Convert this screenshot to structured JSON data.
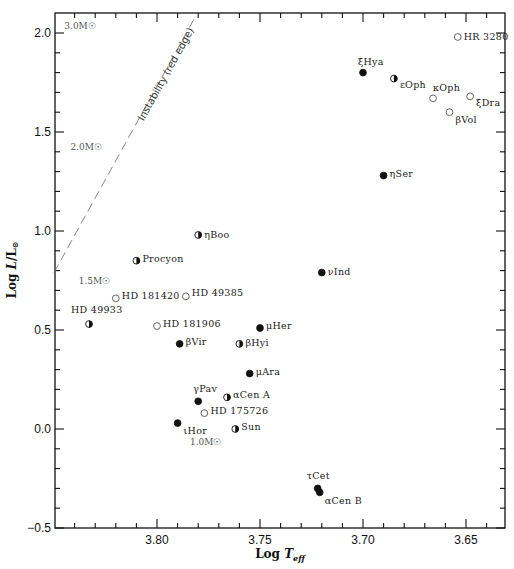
{
  "chart_data": {
    "type": "scatter",
    "title": "",
    "xlabel": "Log T_eff",
    "ylabel": "Log L/L_sun",
    "xlim": [
      3.85,
      3.631
    ],
    "ylim": [
      -0.5,
      2.1
    ],
    "x_inverted": true,
    "grid": false,
    "x_ticks": [
      3.8,
      3.75,
      3.7,
      3.65
    ],
    "x_tick_labels": [
      "3.80",
      "3.75",
      "3.70",
      "3.65"
    ],
    "y_ticks": [
      -0.5,
      0.0,
      0.5,
      1.0,
      1.5,
      2.0
    ],
    "y_tick_labels": [
      "-0.5",
      "0.0",
      "0.5",
      "1.0",
      "1.5",
      "2.0"
    ],
    "marker_legend": {
      "filled": "filled circle",
      "half": "half-filled circle",
      "open": "open circle"
    },
    "points": [
      {
        "name": "HR 3280",
        "logT": 3.654,
        "logL": 1.98,
        "marker": "open",
        "label_dx": 6,
        "label_dy": 0
      },
      {
        "name": "ξHya",
        "logT": 3.7,
        "logL": 1.8,
        "marker": "filled",
        "label_dx": -5,
        "label_dy": -11
      },
      {
        "name": "εOph",
        "logT": 3.685,
        "logL": 1.77,
        "marker": "half",
        "label_dx": 6,
        "label_dy": 6
      },
      {
        "name": "κOph",
        "logT": 3.666,
        "logL": 1.67,
        "marker": "open",
        "label_dx": 0,
        "label_dy": -10
      },
      {
        "name": "ξDra",
        "logT": 3.648,
        "logL": 1.68,
        "marker": "open",
        "label_dx": 6,
        "label_dy": 7
      },
      {
        "name": "βVol",
        "logT": 3.658,
        "logL": 1.6,
        "marker": "open",
        "label_dx": 6,
        "label_dy": 8
      },
      {
        "name": "ηSer",
        "logT": 3.69,
        "logL": 1.28,
        "marker": "filled",
        "label_dx": 6,
        "label_dy": -2
      },
      {
        "name": "ηBoo",
        "logT": 3.78,
        "logL": 0.98,
        "marker": "half",
        "label_dx": 6,
        "label_dy": 0
      },
      {
        "name": "Procyon",
        "logT": 3.81,
        "logL": 0.85,
        "marker": "half",
        "label_dx": 6,
        "label_dy": -2
      },
      {
        "name": "νInd",
        "logT": 3.72,
        "logL": 0.79,
        "marker": "filled",
        "label_dx": 6,
        "label_dy": -1
      },
      {
        "name": "HD 181420",
        "logT": 3.82,
        "logL": 0.66,
        "marker": "open",
        "label_dx": 6,
        "label_dy": -2
      },
      {
        "name": "HD 49385",
        "logT": 3.786,
        "logL": 0.67,
        "marker": "open",
        "label_dx": 6,
        "label_dy": -3
      },
      {
        "name": "HD 49933",
        "logT": 3.833,
        "logL": 0.53,
        "marker": "half",
        "label_dx": -18,
        "label_dy": -14
      },
      {
        "name": "HD 181906",
        "logT": 3.8,
        "logL": 0.52,
        "marker": "open",
        "label_dx": 6,
        "label_dy": -2
      },
      {
        "name": "μHer",
        "logT": 3.75,
        "logL": 0.51,
        "marker": "filled",
        "label_dx": 6,
        "label_dy": -2
      },
      {
        "name": "βVir",
        "logT": 3.789,
        "logL": 0.43,
        "marker": "filled",
        "label_dx": 6,
        "label_dy": -2
      },
      {
        "name": "βHyi",
        "logT": 3.76,
        "logL": 0.43,
        "marker": "half",
        "label_dx": 6,
        "label_dy": -1
      },
      {
        "name": "μAra",
        "logT": 3.755,
        "logL": 0.28,
        "marker": "filled",
        "label_dx": 6,
        "label_dy": -2
      },
      {
        "name": "γPav",
        "logT": 3.78,
        "logL": 0.14,
        "marker": "filled",
        "label_dx": -5,
        "label_dy": -12
      },
      {
        "name": "αCen A",
        "logT": 3.766,
        "logL": 0.16,
        "marker": "half",
        "label_dx": 6,
        "label_dy": -2
      },
      {
        "name": "HD 175726",
        "logT": 3.777,
        "logL": 0.08,
        "marker": "open",
        "label_dx": 6,
        "label_dy": -2
      },
      {
        "name": "ιHor",
        "logT": 3.79,
        "logL": 0.03,
        "marker": "filled",
        "label_dx": 6,
        "label_dy": 8
      },
      {
        "name": "Sun",
        "logT": 3.762,
        "logL": 0.0,
        "marker": "half",
        "label_dx": 6,
        "label_dy": -2
      },
      {
        "name": "τCet",
        "logT": 3.722,
        "logL": -0.3,
        "marker": "filled",
        "label_dx": -11,
        "label_dy": -12
      },
      {
        "name": "αCen B",
        "logT": 3.721,
        "logL": -0.32,
        "marker": "filled",
        "label_dx": 5,
        "label_dy": 9
      }
    ],
    "mass_labels": [
      {
        "text": "3.0M☉",
        "logT": 3.845,
        "logL": 2.02
      },
      {
        "text": "2.0M☉",
        "logT": 3.842,
        "logL": 1.41
      },
      {
        "text": "1.5M☉",
        "logT": 3.838,
        "logL": 0.73
      },
      {
        "text": "1.0M☉",
        "logT": 3.784,
        "logL": -0.08
      }
    ],
    "annotations": [
      {
        "text": "Instability (red edge)",
        "type": "dashed-line",
        "from": {
          "logT": 3.85,
          "logL": 0.79
        },
        "to": {
          "logT": 3.781,
          "logL": 2.09
        }
      }
    ]
  },
  "labels": {
    "xlabel_main": "Log ",
    "xlabel_sym": "T",
    "xlabel_sub": "eff",
    "ylabel_main": "Log ",
    "ylabel_sym": "L",
    "ylabel_rest": "/L",
    "ylabel_sub": "⊙"
  }
}
